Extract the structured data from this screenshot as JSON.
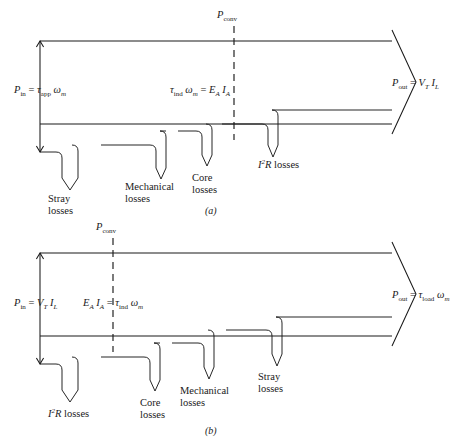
{
  "figure": {
    "title_absent": true,
    "panels": [
      {
        "id": "a",
        "caption": "(a)",
        "machine": "dc generator",
        "input": {
          "name": "P_in",
          "text_main": "P",
          "text_sub": "in",
          "equals": "=",
          "expr_tau": "τ",
          "expr_tau_sub": "app",
          "expr_omega": "ω",
          "expr_omega_sub": "m",
          "full": "P_in = τ_app ω_m"
        },
        "conv": {
          "text_main": "P",
          "text_sub": "conv",
          "full": "P_conv"
        },
        "mid": {
          "tau": "τ",
          "tau_sub": "ind",
          "omega": "ω",
          "omega_sub": "m",
          "equals": "=",
          "E": "E",
          "E_sub": "A",
          "I": "I",
          "I_sub": "A",
          "full": "τ_ind ω_m = E_A I_A"
        },
        "output": {
          "text_main": "P",
          "text_sub": "out",
          "equals": "=",
          "V": "V",
          "V_sub": "T",
          "I": "I",
          "I_sub": "L",
          "full": "P_out = V_T I_L"
        },
        "losses": [
          {
            "id": "stray",
            "line1": "Stray",
            "line2": "losses",
            "full": "Stray losses"
          },
          {
            "id": "mechanical",
            "line1": "Mechanical",
            "line2": "losses",
            "full": "Mechanical losses"
          },
          {
            "id": "core",
            "line1": "Core",
            "line2": "losses",
            "full": "Core losses"
          },
          {
            "id": "i2r",
            "I": "I",
            "sup": "2",
            "R": "R",
            "word": "losses",
            "full": "I²R losses"
          }
        ]
      },
      {
        "id": "b",
        "caption": "(b)",
        "machine": "dc motor",
        "input": {
          "text_main": "P",
          "text_sub": "in",
          "equals": "=",
          "V": "V",
          "V_sub": "T",
          "I": "I",
          "I_sub": "L",
          "full": "P_in = V_T I_L"
        },
        "conv": {
          "text_main": "P",
          "text_sub": "conv",
          "full": "P_conv"
        },
        "mid": {
          "E": "E",
          "E_sub": "A",
          "I": "I",
          "I_sub": "A",
          "equals": "=",
          "tau": "τ",
          "tau_sub": "ind",
          "omega": "ω",
          "omega_sub": "m",
          "full": "E_A I_A = τ_ind ω_m"
        },
        "output": {
          "text_main": "P",
          "text_sub": "out",
          "equals": "=",
          "tau": "τ",
          "tau_sub": "load",
          "omega": "ω",
          "omega_sub": "m",
          "full": "P_out = τ_load ω_m"
        },
        "losses": [
          {
            "id": "i2r",
            "I": "I",
            "sup": "2",
            "R": "R",
            "word": "losses",
            "full": "I²R losses"
          },
          {
            "id": "core",
            "line1": "Core",
            "line2": "losses",
            "full": "Core losses"
          },
          {
            "id": "mechanical",
            "line1": "Mechanical",
            "line2": "losses",
            "full": "Mechanical losses"
          },
          {
            "id": "stray",
            "line1": "Stray",
            "line2": "losses",
            "full": "Stray losses"
          }
        ]
      }
    ],
    "colors": {
      "ink": "#1a1a1a",
      "background": "#ffffff"
    }
  }
}
